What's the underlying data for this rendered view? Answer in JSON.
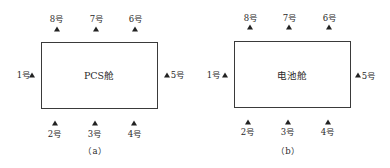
{
  "diagrams": [
    {
      "id": "a",
      "cabin_label": "PCS舱",
      "caption": "（a）",
      "sensors": [
        {
          "num": "1号",
          "side": "left"
        },
        {
          "num": "2号",
          "side": "bottom"
        },
        {
          "num": "3号",
          "side": "bottom"
        },
        {
          "num": "4号",
          "side": "bottom"
        },
        {
          "num": "5号",
          "side": "right"
        },
        {
          "num": "6号",
          "side": "top"
        },
        {
          "num": "7号",
          "side": "top"
        },
        {
          "num": "8号",
          "side": "top"
        }
      ]
    },
    {
      "id": "b",
      "cabin_label": "电池舱",
      "caption": "（b）",
      "sensors": [
        {
          "num": "1号",
          "side": "left"
        },
        {
          "num": "2号",
          "side": "bottom"
        },
        {
          "num": "3号",
          "side": "bottom"
        },
        {
          "num": "4号",
          "side": "bottom"
        },
        {
          "num": "5号",
          "side": "right"
        },
        {
          "num": "6号",
          "side": "top"
        },
        {
          "num": "7号",
          "side": "top"
        },
        {
          "num": "8号",
          "side": "top"
        }
      ]
    }
  ],
  "colors": {
    "line": "#3a3a3a",
    "marker": "#222222",
    "text": "#2a2a2a"
  }
}
